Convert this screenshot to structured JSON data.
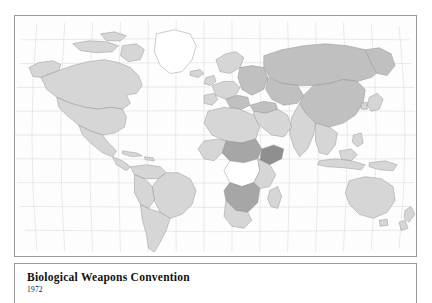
{
  "figure": {
    "kind": "world-choropleth-map",
    "caption": {
      "title": "Biological Weapons Convention",
      "year": "1972"
    }
  },
  "map": {
    "projection": "robinson",
    "graticule": {
      "visible": true,
      "meridian_spacing_deg": 20,
      "parallel_spacing_deg": 20,
      "color": "#d8d8d8"
    },
    "colors": {
      "ocean": "#fdfdfd",
      "border": "#9a9a9a",
      "coastline": "#8a8a8a",
      "country_border": "#8e8e8e",
      "shade_none": "#ffffff",
      "shade_light": "#d6d6d6",
      "shade_medium": "#c0c0c0",
      "shade_dark": "#a6a6a6",
      "shade_darkest": "#8f8f8f"
    },
    "regions": [
      {
        "name": "canada",
        "shade": "shade_light"
      },
      {
        "name": "united-states",
        "shade": "shade_light"
      },
      {
        "name": "alaska",
        "shade": "shade_light"
      },
      {
        "name": "greenland",
        "shade": "shade_none"
      },
      {
        "name": "mexico",
        "shade": "shade_light"
      },
      {
        "name": "central-america",
        "shade": "shade_light"
      },
      {
        "name": "caribbean",
        "shade": "shade_light"
      },
      {
        "name": "colombia-venezuela",
        "shade": "shade_light"
      },
      {
        "name": "brazil",
        "shade": "shade_light"
      },
      {
        "name": "peru-bolivia",
        "shade": "shade_light"
      },
      {
        "name": "argentina-chile",
        "shade": "shade_light"
      },
      {
        "name": "iceland",
        "shade": "shade_light"
      },
      {
        "name": "scandinavia",
        "shade": "shade_light"
      },
      {
        "name": "western-europe",
        "shade": "shade_light"
      },
      {
        "name": "eastern-europe",
        "shade": "shade_medium"
      },
      {
        "name": "russia",
        "shade": "shade_medium"
      },
      {
        "name": "central-asia",
        "shade": "shade_medium"
      },
      {
        "name": "china",
        "shade": "shade_medium"
      },
      {
        "name": "india",
        "shade": "shade_light"
      },
      {
        "name": "middle-east",
        "shade": "shade_light"
      },
      {
        "name": "north-africa",
        "shade": "shade_light"
      },
      {
        "name": "sahel",
        "shade": "shade_dark"
      },
      {
        "name": "horn-of-africa",
        "shade": "shade_darkest"
      },
      {
        "name": "central-africa",
        "shade": "shade_none"
      },
      {
        "name": "east-africa",
        "shade": "shade_light"
      },
      {
        "name": "southern-africa",
        "shade": "shade_dark"
      },
      {
        "name": "south-africa",
        "shade": "shade_light"
      },
      {
        "name": "madagascar",
        "shade": "shade_light"
      },
      {
        "name": "southeast-asia",
        "shade": "shade_light"
      },
      {
        "name": "indonesia",
        "shade": "shade_light"
      },
      {
        "name": "japan-korea",
        "shade": "shade_light"
      },
      {
        "name": "australia",
        "shade": "shade_light"
      },
      {
        "name": "new-zealand",
        "shade": "shade_light"
      }
    ]
  }
}
